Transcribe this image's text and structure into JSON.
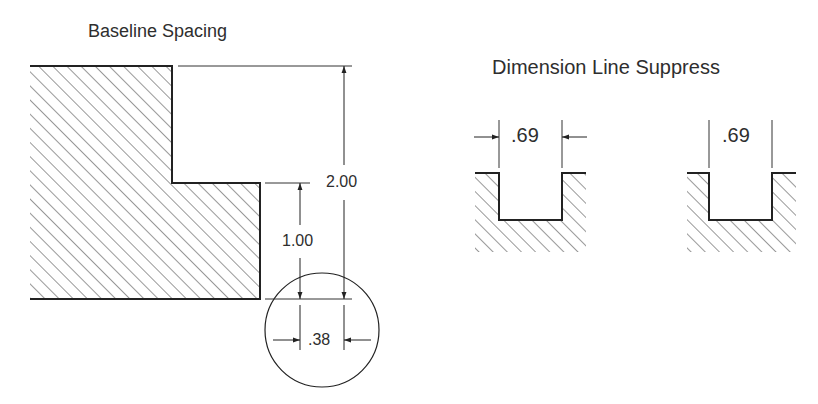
{
  "diagram": {
    "left_panel": {
      "title": "Baseline Spacing",
      "dimensions": {
        "overall_height": "2.00",
        "step_height": "1.00",
        "detail_width": ".38"
      }
    },
    "right_panel": {
      "title": "Dimension Line Suppress",
      "examples": [
        {
          "label": ".69",
          "arrows": "outside"
        },
        {
          "label": ".69",
          "arrows": "suppressed"
        }
      ]
    },
    "colors": {
      "stroke": "#222222",
      "text": "#2e2e2e",
      "background": "#ffffff"
    }
  }
}
